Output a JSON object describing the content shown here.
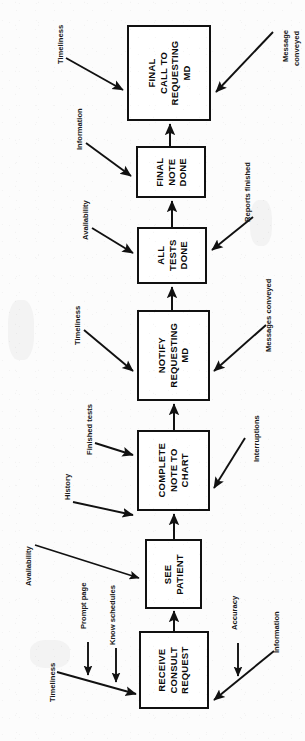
{
  "diagram": {
    "type": "process-flowchart",
    "orientation": "rotated-90-counterclockwise",
    "title": "",
    "nodes": [
      {
        "id": "receive",
        "label": "RECEIVE\nCONSULT\nREQUEST"
      },
      {
        "id": "see",
        "label": "SEE\nPATIENT"
      },
      {
        "id": "complete",
        "label": "COMPLETE\nNOTE TO\nCHART"
      },
      {
        "id": "notify",
        "label": "NOTIFY\nREQUESTING\nMD"
      },
      {
        "id": "tests",
        "label": "ALL\nTESTS\nDONE"
      },
      {
        "id": "finalnote",
        "label": "FINAL\nNOTE\nDONE"
      },
      {
        "id": "finalcall",
        "label": "FINAL\nCALL TO\nREQUESTING\nMD"
      }
    ],
    "input_labels": [
      {
        "id": "timeliness-receive",
        "text": "Timeliness"
      },
      {
        "id": "prompt-page",
        "text": "Prompt page"
      },
      {
        "id": "know-schedules",
        "text": "Know schedules"
      },
      {
        "id": "accuracy",
        "text": "Accuracy"
      },
      {
        "id": "information-receive",
        "text": "Information"
      },
      {
        "id": "availability-see",
        "text": "Availability"
      },
      {
        "id": "history",
        "text": "History"
      },
      {
        "id": "finished-tests",
        "text": "Finished tests"
      },
      {
        "id": "interruptions",
        "text": "Interruptions"
      },
      {
        "id": "timeliness-notify",
        "text": "Timeliness"
      },
      {
        "id": "messages-conveyed",
        "text": "Messages conveyed"
      },
      {
        "id": "availability-tests",
        "text": "Availability"
      },
      {
        "id": "reports-finished",
        "text": "Reports finished"
      },
      {
        "id": "information-finalnote",
        "text": "Information"
      },
      {
        "id": "timeliness-finalcall",
        "text": "Timeliness"
      },
      {
        "id": "message-conveyed-line1",
        "text": "Message"
      },
      {
        "id": "message-conveyed-line2",
        "text": "conveyed"
      }
    ],
    "colors": {
      "stroke": "#111111",
      "node_fill": "#ffffff",
      "text": "#0a0a0a",
      "background": "#fcfcfc"
    }
  }
}
